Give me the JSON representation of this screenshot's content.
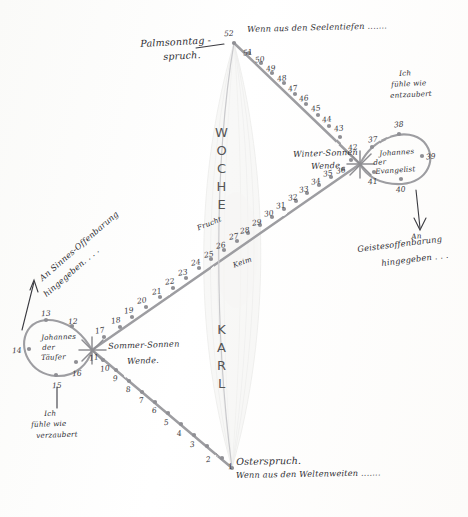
{
  "figure": {
    "kind": "hand-drawn lemniscate calendar diagram",
    "paper_color": "#fdfdfb",
    "ink_color": "#3a3a40",
    "line_color": "#9a9a9e"
  },
  "vertical_words": {
    "upper": "WOCHE",
    "lower": "KARL"
  },
  "center_labels": {
    "above": "Frucht",
    "below": "Keim"
  },
  "nodes": {
    "top": {
      "label_line1": "Palmsonntag -",
      "label_line2": "spruch.",
      "number": "52",
      "verse": "Wenn aus den Seelentiefen ......."
    },
    "bottom": {
      "label": "Osterspruch.",
      "number": "1",
      "verse": "Wenn aus den Weltenweiten ......."
    },
    "left": {
      "label_line1": "Sommer-Sonnen",
      "label_line2": "Wende.",
      "loop_name_line1": "Johannes",
      "loop_name_line2": "der",
      "loop_name_line3": "Täufer",
      "annotation_line1": "Ich",
      "annotation_line2": "fühle wie",
      "annotation_line3": "verzaubert",
      "diagonal_note_line1": "An Sinnes-Offenbarung",
      "diagonal_note_line2": "hingegeben. . . ."
    },
    "right": {
      "label_line1": "Winter-Sonnen",
      "label_line2": "Wende",
      "loop_name_line1": "Johannes",
      "loop_name_line2": "der",
      "loop_name_line3": "Evangelist",
      "annotation_line1": "Ich",
      "annotation_line2": "fühle wie",
      "annotation_line3": "entzaubert",
      "diagonal_note_line1": "An",
      "diagonal_note_line2": "Geistesoffenbarung",
      "diagonal_note_line3": "hingegeben . . ."
    }
  },
  "week_numbers": {
    "lower_left_diagonal": [
      "1",
      "2",
      "3",
      "4",
      "5",
      "6",
      "7",
      "8",
      "9",
      "10",
      "11"
    ],
    "left_loop": [
      "12",
      "13",
      "14",
      "15",
      "16"
    ],
    "upper_right_diagonal_ascending": [
      "17",
      "18",
      "19",
      "20",
      "21",
      "22",
      "23",
      "24",
      "25",
      "26",
      "27",
      "28",
      "29",
      "30",
      "31",
      "32",
      "33",
      "34",
      "35",
      "36"
    ],
    "right_loop": [
      "37",
      "38",
      "39",
      "40",
      "41"
    ],
    "upper_left_return": [
      "42",
      "43",
      "44",
      "45",
      "46",
      "47",
      "48",
      "49",
      "50",
      "51",
      "52"
    ]
  },
  "numbered_points": [
    {
      "n": "1",
      "x": 232,
      "y": 468,
      "lx": 228,
      "ly": 462,
      "rot": -6
    },
    {
      "n": "2",
      "x": 222,
      "y": 458,
      "lx": 206,
      "ly": 455,
      "rot": -8
    },
    {
      "n": "3",
      "x": 207,
      "y": 446,
      "lx": 190,
      "ly": 440,
      "rot": -8
    },
    {
      "n": "4",
      "x": 194,
      "y": 435,
      "lx": 177,
      "ly": 429,
      "rot": -8
    },
    {
      "n": "5",
      "x": 181,
      "y": 424,
      "lx": 164,
      "ly": 418,
      "rot": -8
    },
    {
      "n": "6",
      "x": 168,
      "y": 413,
      "lx": 152,
      "ly": 406,
      "rot": -8
    },
    {
      "n": "7",
      "x": 155,
      "y": 402,
      "lx": 139,
      "ly": 396,
      "rot": -8
    },
    {
      "n": "8",
      "x": 142,
      "y": 392,
      "lx": 126,
      "ly": 385,
      "rot": -8
    },
    {
      "n": "9",
      "x": 129,
      "y": 381,
      "lx": 113,
      "ly": 374,
      "rot": -8
    },
    {
      "n": "10",
      "x": 116,
      "y": 370,
      "lx": 100,
      "ly": 364,
      "rot": -8
    },
    {
      "n": "11",
      "x": 103,
      "y": 360,
      "lx": 89,
      "ly": 353,
      "rot": -8
    },
    {
      "n": "12",
      "x": 72,
      "y": 326,
      "lx": 68,
      "ly": 317,
      "rot": -4
    },
    {
      "n": "13",
      "x": 46,
      "y": 320,
      "lx": 41,
      "ly": 309,
      "rot": -4
    },
    {
      "n": "14",
      "x": 29,
      "y": 349,
      "lx": 12,
      "ly": 346,
      "rot": -4
    },
    {
      "n": "15",
      "x": 56,
      "y": 375,
      "lx": 52,
      "ly": 381,
      "rot": -4
    },
    {
      "n": "16",
      "x": 76,
      "y": 362,
      "lx": 72,
      "ly": 369,
      "rot": -4
    },
    {
      "n": "17",
      "x": 104,
      "y": 337,
      "lx": 95,
      "ly": 326,
      "rot": -10
    },
    {
      "n": "18",
      "x": 120,
      "y": 327,
      "lx": 111,
      "ly": 316,
      "rot": -10
    },
    {
      "n": "19",
      "x": 132,
      "y": 317,
      "lx": 124,
      "ly": 306,
      "rot": -10
    },
    {
      "n": "20",
      "x": 146,
      "y": 307,
      "lx": 137,
      "ly": 296,
      "rot": -10
    },
    {
      "n": "21",
      "x": 160,
      "y": 297,
      "lx": 152,
      "ly": 287,
      "rot": -10
    },
    {
      "n": "22",
      "x": 173,
      "y": 288,
      "lx": 165,
      "ly": 277,
      "rot": -10
    },
    {
      "n": "23",
      "x": 186,
      "y": 278,
      "lx": 178,
      "ly": 268,
      "rot": -10
    },
    {
      "n": "24",
      "x": 199,
      "y": 268,
      "lx": 191,
      "ly": 258,
      "rot": -10
    },
    {
      "n": "25",
      "x": 211,
      "y": 259,
      "lx": 204,
      "ly": 250,
      "rot": -10
    },
    {
      "n": "26",
      "x": 224,
      "y": 250,
      "lx": 216,
      "ly": 241,
      "rot": -10
    },
    {
      "n": "27",
      "x": 237,
      "y": 241,
      "lx": 229,
      "ly": 232,
      "rot": -10
    },
    {
      "n": "28",
      "x": 248,
      "y": 233,
      "lx": 240,
      "ly": 226,
      "rot": -10
    },
    {
      "n": "29",
      "x": 260,
      "y": 225,
      "lx": 252,
      "ly": 218,
      "rot": -10
    },
    {
      "n": "30",
      "x": 272,
      "y": 217,
      "lx": 264,
      "ly": 209,
      "rot": -10
    },
    {
      "n": "31",
      "x": 284,
      "y": 209,
      "lx": 276,
      "ly": 201,
      "rot": -10
    },
    {
      "n": "32",
      "x": 296,
      "y": 201,
      "lx": 288,
      "ly": 193,
      "rot": -10
    },
    {
      "n": "33",
      "x": 307,
      "y": 193,
      "lx": 299,
      "ly": 185,
      "rot": -10
    },
    {
      "n": "34",
      "x": 319,
      "y": 185,
      "lx": 311,
      "ly": 177,
      "rot": -10
    },
    {
      "n": "35",
      "x": 331,
      "y": 177,
      "lx": 323,
      "ly": 169,
      "rot": -10
    },
    {
      "n": "36",
      "x": 343,
      "y": 169,
      "lx": 336,
      "ly": 166,
      "rot": -10
    },
    {
      "n": "37",
      "x": 372,
      "y": 147,
      "lx": 368,
      "ly": 135,
      "rot": -6
    },
    {
      "n": "38",
      "x": 399,
      "y": 134,
      "lx": 394,
      "ly": 120,
      "rot": -6
    },
    {
      "n": "39",
      "x": 422,
      "y": 156,
      "lx": 426,
      "ly": 152,
      "rot": -6
    },
    {
      "n": "40",
      "x": 401,
      "y": 179,
      "lx": 396,
      "ly": 185,
      "rot": -6
    },
    {
      "n": "41",
      "x": 374,
      "y": 172,
      "lx": 368,
      "ly": 177,
      "rot": -6
    },
    {
      "n": "42",
      "x": 351,
      "y": 160,
      "lx": 348,
      "ly": 143,
      "rot": -10
    },
    {
      "n": "43",
      "x": 340,
      "y": 137,
      "lx": 334,
      "ly": 124,
      "rot": -10
    },
    {
      "n": "44",
      "x": 329,
      "y": 126,
      "lx": 322,
      "ly": 115,
      "rot": -10
    },
    {
      "n": "45",
      "x": 318,
      "y": 115,
      "lx": 311,
      "ly": 104,
      "rot": -10
    },
    {
      "n": "46",
      "x": 306,
      "y": 104,
      "lx": 299,
      "ly": 94,
      "rot": -10
    },
    {
      "n": "47",
      "x": 295,
      "y": 94,
      "lx": 288,
      "ly": 84,
      "rot": -10
    },
    {
      "n": "48",
      "x": 284,
      "y": 83,
      "lx": 277,
      "ly": 74,
      "rot": -10
    },
    {
      "n": "49",
      "x": 272,
      "y": 73,
      "lx": 266,
      "ly": 64,
      "rot": -10
    },
    {
      "n": "50",
      "x": 261,
      "y": 63,
      "lx": 255,
      "ly": 55,
      "rot": -10
    },
    {
      "n": "51",
      "x": 249,
      "y": 53,
      "lx": 243,
      "ly": 48,
      "rot": -10
    },
    {
      "n": "52",
      "x": 234,
      "y": 43,
      "lx": 224,
      "ly": 29,
      "rot": -4
    }
  ]
}
